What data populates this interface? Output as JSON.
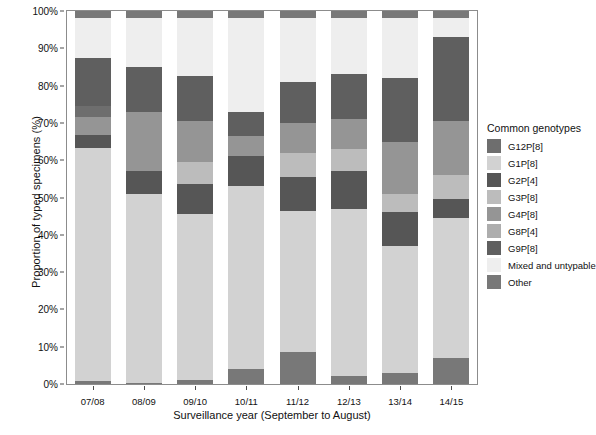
{
  "chart_data": {
    "type": "bar",
    "stacked": true,
    "stack_normalized": true,
    "title": "",
    "xlabel": "Surveillance year (September to August)",
    "ylabel": "Proportion of typed specimens (%)",
    "categories": [
      "07/08",
      "08/09",
      "09/10",
      "10/11",
      "11/12",
      "12/13",
      "13/14",
      "14/15"
    ],
    "ylim": [
      0,
      100
    ],
    "ytick_labels": [
      "0%",
      "10%",
      "20%",
      "30%",
      "40%",
      "50%",
      "60%",
      "70%",
      "80%",
      "90%",
      "100%"
    ],
    "ytick_values": [
      0,
      10,
      20,
      30,
      40,
      50,
      60,
      70,
      80,
      90,
      100
    ],
    "grid": false,
    "legend_position": "right",
    "legend_title": "Common genotypes",
    "series": [
      {
        "name": "G12P[8]",
        "color": "#6e6e6e",
        "values": [
          0.0,
          0.0,
          0.0,
          0.0,
          0.0,
          0.0,
          0.0,
          0.0
        ]
      },
      {
        "name": "G1P[8]",
        "color": "#d2d2d2",
        "values": [
          63.0,
          56.0,
          48.5,
          41.5,
          37.0,
          45.0,
          39.5,
          40.0
        ]
      },
      {
        "name": "G2P[4]",
        "color": "#565656",
        "values": [
          3.5,
          6.5,
          9.0,
          12.0,
          10.0,
          10.0,
          9.0,
          6.0
        ]
      },
      {
        "name": "G3P[8]",
        "color": "#bcbcbc",
        "values": [
          2.5,
          12.0,
          9.5,
          5.5,
          8.5,
          8.0,
          7.5,
          7.0
        ]
      },
      {
        "name": "G4P[8]",
        "color": "#959595",
        "values": [
          6.5,
          6.5,
          9.0,
          6.5,
          10.0,
          9.0,
          14.5,
          15.0
        ]
      },
      {
        "name": "G8P[4]",
        "color": "#adadad",
        "values": [
          0.0,
          0.0,
          0.0,
          5.0,
          0.0,
          0.0,
          0.0,
          0.0
        ]
      },
      {
        "name": "G9P[8]",
        "color": "#5f5f5f",
        "values": [
          11.5,
          8.0,
          11.0,
          8.5,
          11.5,
          11.0,
          16.0,
          20.0
        ]
      },
      {
        "name": "Mixed and untypable",
        "color": "#eeeeee",
        "values": [
          11.5,
          9.0,
          11.0,
          19.5,
          21.0,
          15.0,
          12.0,
          6.0
        ]
      },
      {
        "name": "Other",
        "color": "#787878",
        "values": [
          1.5,
          2.0,
          2.0,
          1.5,
          2.0,
          2.0,
          1.5,
          6.0
        ]
      }
    ],
    "bottom_other_segments": {
      "note": "small dark 'Other' band at base of each bar",
      "values": [
        0.8,
        0.4,
        1.2,
        4.0,
        8.5,
        2.2,
        3.0,
        7.0
      ]
    },
    "stack_order_bottom_to_top": [
      "Other",
      "G1P[8]",
      "G2P[4]",
      "G3P[8]",
      "G4P[8]",
      "G8P[4]",
      "G9P[8]",
      "Mixed and untypable",
      "G12P[8]"
    ],
    "bars": [
      {
        "category": "07/08",
        "segments": [
          {
            "name": "Other",
            "value": 0.8,
            "color": "#787878"
          },
          {
            "name": "G1P[8]",
            "value": 62.4,
            "color": "#d2d2d2"
          },
          {
            "name": "G2P[4]",
            "value": 3.5,
            "color": "#565656"
          },
          {
            "name": "G4P[8]",
            "value": 5.0,
            "color": "#959595"
          },
          {
            "name": "G9P[8]",
            "value": 2.8,
            "color": "#6e6e6e"
          },
          {
            "name": "G12P[8]",
            "value": 13.0,
            "color": "#5f5f5f"
          },
          {
            "name": "Mixed and untypable",
            "value": 10.5,
            "color": "#eeeeee"
          },
          {
            "name": "Other",
            "value": 2.0,
            "color": "#787878"
          }
        ]
      },
      {
        "category": "08/09",
        "segments": [
          {
            "name": "Other",
            "value": 0.4,
            "color": "#787878"
          },
          {
            "name": "G1P[8]",
            "value": 50.6,
            "color": "#d2d2d2"
          },
          {
            "name": "G2P[4]",
            "value": 6.0,
            "color": "#565656"
          },
          {
            "name": "G4P[8]",
            "value": 16.0,
            "color": "#959595"
          },
          {
            "name": "G12P[8]",
            "value": 12.0,
            "color": "#5f5f5f"
          },
          {
            "name": "Mixed and untypable",
            "value": 13.0,
            "color": "#eeeeee"
          },
          {
            "name": "Other",
            "value": 2.0,
            "color": "#787878"
          }
        ]
      },
      {
        "category": "09/10",
        "segments": [
          {
            "name": "Other",
            "value": 1.2,
            "color": "#787878"
          },
          {
            "name": "G1P[8]",
            "value": 44.3,
            "color": "#d2d2d2"
          },
          {
            "name": "G2P[4]",
            "value": 8.0,
            "color": "#565656"
          },
          {
            "name": "G3P[8]",
            "value": 6.0,
            "color": "#bcbcbc"
          },
          {
            "name": "G4P[8]",
            "value": 11.0,
            "color": "#959595"
          },
          {
            "name": "G12P[8]",
            "value": 12.0,
            "color": "#5f5f5f"
          },
          {
            "name": "Mixed and untypable",
            "value": 15.5,
            "color": "#eeeeee"
          },
          {
            "name": "Other",
            "value": 2.0,
            "color": "#787878"
          }
        ]
      },
      {
        "category": "10/11",
        "segments": [
          {
            "name": "Other",
            "value": 4.0,
            "color": "#787878"
          },
          {
            "name": "G1P[8]",
            "value": 49.0,
            "color": "#d2d2d2"
          },
          {
            "name": "G2P[4]",
            "value": 8.0,
            "color": "#565656"
          },
          {
            "name": "G4P[8]",
            "value": 5.5,
            "color": "#959595"
          },
          {
            "name": "G12P[8]",
            "value": 6.5,
            "color": "#5f5f5f"
          },
          {
            "name": "Mixed and untypable",
            "value": 25.0,
            "color": "#eeeeee"
          },
          {
            "name": "Other",
            "value": 2.0,
            "color": "#787878"
          }
        ]
      },
      {
        "category": "11/12",
        "segments": [
          {
            "name": "Other",
            "value": 8.5,
            "color": "#787878"
          },
          {
            "name": "G1P[8]",
            "value": 38.0,
            "color": "#d2d2d2"
          },
          {
            "name": "G2P[4]",
            "value": 9.0,
            "color": "#565656"
          },
          {
            "name": "G3P[8]",
            "value": 6.5,
            "color": "#bcbcbc"
          },
          {
            "name": "G4P[8]",
            "value": 8.0,
            "color": "#959595"
          },
          {
            "name": "G12P[8]",
            "value": 11.0,
            "color": "#5f5f5f"
          },
          {
            "name": "Mixed and untypable",
            "value": 17.0,
            "color": "#eeeeee"
          },
          {
            "name": "Other",
            "value": 2.0,
            "color": "#787878"
          }
        ]
      },
      {
        "category": "12/13",
        "segments": [
          {
            "name": "Other",
            "value": 2.2,
            "color": "#787878"
          },
          {
            "name": "G1P[8]",
            "value": 44.8,
            "color": "#d2d2d2"
          },
          {
            "name": "G2P[4]",
            "value": 10.0,
            "color": "#565656"
          },
          {
            "name": "G3P[8]",
            "value": 6.0,
            "color": "#bcbcbc"
          },
          {
            "name": "G4P[8]",
            "value": 8.0,
            "color": "#959595"
          },
          {
            "name": "G12P[8]",
            "value": 12.0,
            "color": "#5f5f5f"
          },
          {
            "name": "Mixed and untypable",
            "value": 15.0,
            "color": "#eeeeee"
          },
          {
            "name": "Other",
            "value": 2.0,
            "color": "#787878"
          }
        ]
      },
      {
        "category": "13/14",
        "segments": [
          {
            "name": "Other",
            "value": 3.0,
            "color": "#787878"
          },
          {
            "name": "G1P[8]",
            "value": 34.0,
            "color": "#d2d2d2"
          },
          {
            "name": "G2P[4]",
            "value": 9.0,
            "color": "#565656"
          },
          {
            "name": "G3P[8]",
            "value": 5.0,
            "color": "#bcbcbc"
          },
          {
            "name": "G4P[8]",
            "value": 14.0,
            "color": "#959595"
          },
          {
            "name": "G12P[8]",
            "value": 17.0,
            "color": "#5f5f5f"
          },
          {
            "name": "Mixed and untypable",
            "value": 16.0,
            "color": "#eeeeee"
          },
          {
            "name": "Other",
            "value": 2.0,
            "color": "#787878"
          }
        ]
      },
      {
        "category": "14/15",
        "segments": [
          {
            "name": "Other",
            "value": 7.0,
            "color": "#787878"
          },
          {
            "name": "G1P[8]",
            "value": 37.5,
            "color": "#d2d2d2"
          },
          {
            "name": "G2P[4]",
            "value": 5.0,
            "color": "#565656"
          },
          {
            "name": "G3P[8]",
            "value": 6.5,
            "color": "#bcbcbc"
          },
          {
            "name": "G4P[8]",
            "value": 14.5,
            "color": "#959595"
          },
          {
            "name": "G12P[8]",
            "value": 22.5,
            "color": "#5f5f5f"
          },
          {
            "name": "Mixed and untypable",
            "value": 5.0,
            "color": "#eeeeee"
          },
          {
            "name": "Other",
            "value": 2.0,
            "color": "#787878"
          }
        ]
      }
    ]
  },
  "legend": {
    "title": "Common genotypes",
    "items": [
      {
        "label": "G12P[8]",
        "color": "#6e6e6e"
      },
      {
        "label": "G1P[8]",
        "color": "#d2d2d2"
      },
      {
        "label": "G2P[4]",
        "color": "#565656"
      },
      {
        "label": "G3P[8]",
        "color": "#bcbcbc"
      },
      {
        "label": "G4P[8]",
        "color": "#959595"
      },
      {
        "label": "G8P[4]",
        "color": "#adadad"
      },
      {
        "label": "G9P[8]",
        "color": "#5f5f5f"
      },
      {
        "label": "Mixed and untypable",
        "color": "#eeeeee"
      },
      {
        "label": "Other",
        "color": "#787878"
      }
    ]
  },
  "axes": {
    "y_title": "Proportion of typed specimens (%)",
    "x_title": "Surveillance year (September to August)"
  }
}
